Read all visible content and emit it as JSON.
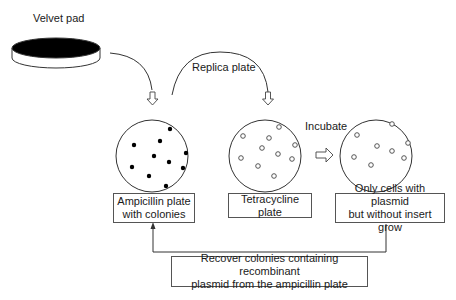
{
  "labels": {
    "velvet_pad": "Velvet pad",
    "replica_plate": "Replica plate",
    "incubate": "Incubate"
  },
  "boxes": {
    "ampicillin": [
      "Ampicillin plate",
      "with colonies"
    ],
    "tetracycline": [
      "Tetracycline plate"
    ],
    "only_cells": [
      "Only cells with plasmid",
      "but without insert grow"
    ],
    "recover": [
      "Recover colonies containing recombinant",
      "plasmid from the ampicillin plate"
    ]
  },
  "plates": {
    "ampicillin": {
      "colony_style": "filled",
      "colony_count": 11
    },
    "tetracycline": {
      "colony_style": "hollow",
      "colony_count": 11
    },
    "only_cells": {
      "colony_style": "hollow",
      "colony_count": 8
    }
  },
  "colors": {
    "line": "#333333",
    "pad_top": "#000000",
    "box_border": "#555555"
  }
}
